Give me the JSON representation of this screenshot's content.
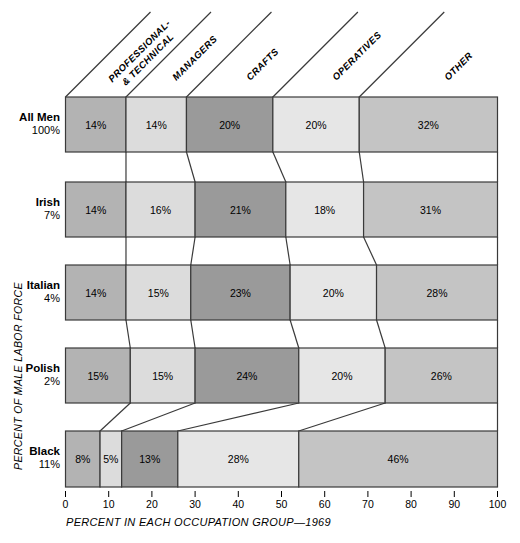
{
  "chart_data": {
    "type": "bar",
    "subtype": "100% stacked horizontal bar",
    "title": "",
    "xlabel": "PERCENT IN EACH OCCUPATION GROUP—1969",
    "ylabel": "PERCENT OF MALE LABOR FORCE",
    "xlim": [
      0,
      100
    ],
    "xticks": [
      0,
      10,
      20,
      30,
      40,
      50,
      60,
      70,
      80,
      90,
      100
    ],
    "xtick_labels": [
      "0",
      "10",
      "20",
      "30",
      "40",
      "50",
      "60",
      "70",
      "80",
      "90",
      "100"
    ],
    "grid": false,
    "legend": "column headers along top, angled 45 degrees",
    "categories": [
      "PROFESSIONAL & TECHNICAL",
      "MANAGERS",
      "CRAFTS",
      "OPERATIVES",
      "OTHER"
    ],
    "category_lines": [
      [
        "PROFESSIONAL-",
        "& TECHNICAL"
      ],
      [
        "MANAGERS"
      ],
      [
        "CRAFTS"
      ],
      [
        "OPERATIVES"
      ],
      [
        "OTHER"
      ]
    ],
    "category_colors": [
      "#b3b3b3",
      "#dcdcdc",
      "#9a9a9a",
      "#e6e6e6",
      "#c4c4c4"
    ],
    "rows": [
      {
        "group": "All Men",
        "share": "100%",
        "values": [
          14,
          14,
          20,
          20,
          32
        ],
        "labels": [
          "14%",
          "14%",
          "20%",
          "20%",
          "32%"
        ]
      },
      {
        "group": "Irish",
        "share": "7%",
        "values": [
          14,
          16,
          21,
          18,
          31
        ],
        "labels": [
          "14%",
          "16%",
          "21%",
          "18%",
          "31%"
        ]
      },
      {
        "group": "Italian",
        "share": "4%",
        "values": [
          14,
          15,
          23,
          20,
          28
        ],
        "labels": [
          "14%",
          "15%",
          "23%",
          "20%",
          "28%"
        ]
      },
      {
        "group": "Polish",
        "share": "2%",
        "values": [
          15,
          15,
          24,
          20,
          26
        ],
        "labels": [
          "15%",
          "15%",
          "24%",
          "20%",
          "26%"
        ]
      },
      {
        "group": "Black",
        "share": "11%",
        "values": [
          8,
          5,
          13,
          28,
          46
        ],
        "labels": [
          "8%",
          "5%",
          "13%",
          "28%",
          "46%"
        ]
      }
    ]
  }
}
